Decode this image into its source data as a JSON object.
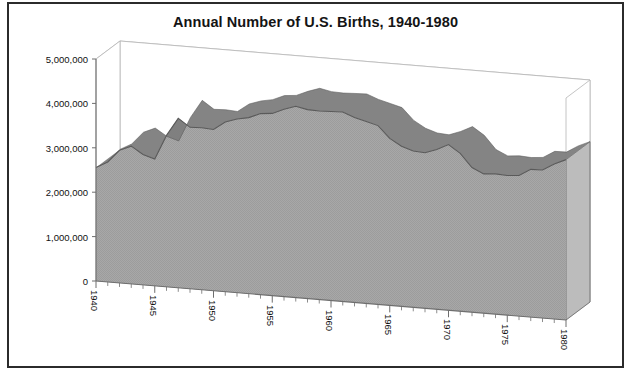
{
  "chart_data": {
    "type": "area",
    "title": "Annual Number of U.S. Births, 1940-1980",
    "xlabel": "",
    "ylabel": "",
    "grid": true,
    "legend": "none",
    "three_d": true,
    "xlim": [
      1940,
      1980
    ],
    "ylim": [
      0,
      5000000
    ],
    "y_ticks": [
      0,
      1000000,
      2000000,
      3000000,
      4000000,
      5000000
    ],
    "y_tick_labels": [
      "0",
      "1,000,000",
      "2,000,000",
      "3,000,000",
      "4,000,000",
      "5,000,000"
    ],
    "x_ticks": [
      1940,
      1945,
      1950,
      1955,
      1960,
      1965,
      1970,
      1975,
      1980
    ],
    "x_tick_labels": [
      "1940",
      "1945",
      "1950",
      "1955",
      "1960",
      "1965",
      "1970",
      "1975",
      "1980"
    ],
    "x_minor_tick_interval": 1,
    "series": [
      {
        "name": "U.S. Births",
        "x": [
          1940,
          1941,
          1942,
          1943,
          1944,
          1945,
          1946,
          1947,
          1948,
          1949,
          1950,
          1951,
          1952,
          1953,
          1954,
          1955,
          1956,
          1957,
          1958,
          1959,
          1960,
          1961,
          1962,
          1963,
          1964,
          1965,
          1966,
          1967,
          1968,
          1969,
          1970,
          1971,
          1972,
          1973,
          1974,
          1975,
          1976,
          1977,
          1978,
          1979,
          1980
        ],
        "values": [
          2559000,
          2703000,
          2989000,
          3104000,
          2939000,
          2858000,
          3411000,
          3817000,
          3637000,
          3649000,
          3632000,
          3823000,
          3913000,
          3965000,
          4078000,
          4104000,
          4218000,
          4308000,
          4255000,
          4245000,
          4258000,
          4268000,
          4167000,
          4098000,
          4027000,
          3760000,
          3606000,
          3521000,
          3502000,
          3600000,
          3731000,
          3556000,
          3258000,
          3137000,
          3160000,
          3144000,
          3168000,
          3327000,
          3333000,
          3494000,
          3612000
        ]
      }
    ],
    "colors": {
      "area_fill": "#a8a8a8",
      "area_top_face": "#7d7d7d",
      "area_outline": "#5a5a5a",
      "grid_line": "#b5b5b5",
      "axis_line": "#6e6e6e",
      "text": "#111111",
      "frame": "#2b2b2b",
      "background": "#ffffff"
    }
  },
  "figure": {
    "title": "Annual Number of U.S. Births, 1940-1980"
  }
}
